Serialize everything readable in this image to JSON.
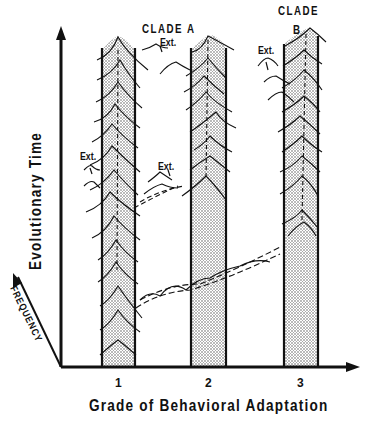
{
  "diagram": {
    "clade_a_label": "CLADE  A",
    "clade_b_label_line1": "CLADE",
    "clade_b_label_line2": "B",
    "extinction_labels": [
      "Ext.",
      "Ext.",
      "Ext.",
      "Ext."
    ],
    "x_axis_title": "Grade of Behavioral Adaptation",
    "y_axis_title": "Evolutionary Time",
    "z_axis_title": "FREQUENCY",
    "x_ticks": [
      "1",
      "2",
      "3"
    ],
    "bands": [
      {
        "grade": "1",
        "fill": "stippled"
      },
      {
        "grade": "2",
        "fill": "stippled"
      },
      {
        "grade": "3",
        "fill": "stippled"
      }
    ],
    "colors": {
      "ink": "#111111",
      "background": "#ffffff",
      "stipple": "#9a9a9a"
    }
  }
}
